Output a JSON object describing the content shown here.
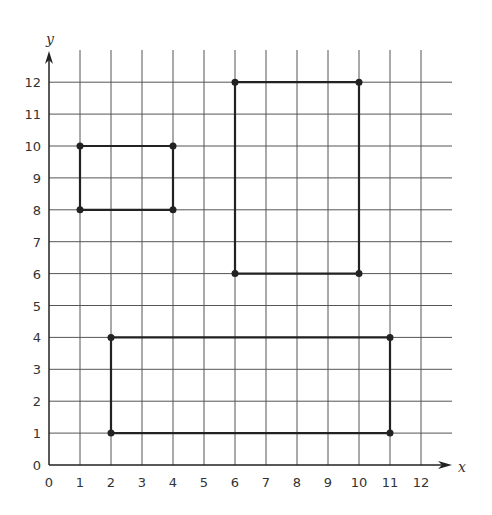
{
  "figure": {
    "x_axis_label": "x",
    "y_axis_label": "y",
    "x_ticks": [
      "0",
      "1",
      "2",
      "3",
      "4",
      "5",
      "6",
      "7",
      "8",
      "9",
      "10",
      "11",
      "12"
    ],
    "y_ticks": [
      "0",
      "1",
      "2",
      "3",
      "4",
      "5",
      "6",
      "7",
      "8",
      "9",
      "10",
      "11",
      "12"
    ],
    "x_range": [
      0,
      12
    ],
    "y_range": [
      0,
      12
    ],
    "grid": true,
    "rectangles": [
      {
        "name": "small-rectangle",
        "vertices": [
          [
            1,
            8
          ],
          [
            4,
            8
          ],
          [
            4,
            10
          ],
          [
            1,
            10
          ]
        ]
      },
      {
        "name": "tall-rectangle",
        "vertices": [
          [
            6,
            6
          ],
          [
            10,
            6
          ],
          [
            10,
            12
          ],
          [
            6,
            12
          ]
        ]
      },
      {
        "name": "wide-rectangle",
        "vertices": [
          [
            2,
            1
          ],
          [
            11,
            1
          ],
          [
            11,
            4
          ],
          [
            2,
            4
          ]
        ]
      }
    ],
    "colors": {
      "grid": "#555555",
      "shape": "#222222",
      "background": "#ffffff"
    }
  }
}
